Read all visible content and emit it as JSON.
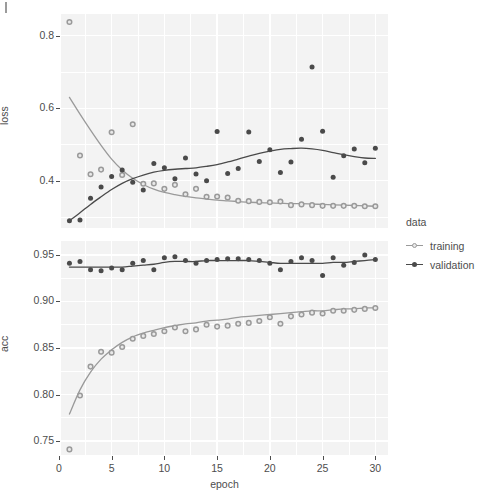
{
  "chart_data": {
    "type": "scatter",
    "title": "",
    "xlabel": "epoch",
    "panels": [
      {
        "id": "loss",
        "ylabel": "loss",
        "ylim": [
          0.27,
          0.86
        ],
        "yticks": [
          0.4,
          0.6,
          0.8
        ],
        "ytick_labels": [
          "0.4",
          "0.6",
          "0.8"
        ],
        "grid": true
      },
      {
        "id": "acc",
        "ylabel": "acc",
        "ylim": [
          0.735,
          0.965
        ],
        "yticks": [
          0.75,
          0.8,
          0.85,
          0.9,
          0.95
        ],
        "ytick_labels": [
          "0.75",
          "0.80",
          "0.85",
          "0.90",
          "0.95"
        ],
        "grid": true
      }
    ],
    "xlim": [
      0.2,
      31.2
    ],
    "xticks": [
      0,
      5,
      10,
      15,
      20,
      25,
      30
    ],
    "xtick_labels": [
      "0",
      "5",
      "10",
      "15",
      "20",
      "25",
      "30"
    ],
    "legend": {
      "title": "data",
      "position": "right",
      "entries": [
        {
          "label": "training",
          "color": "#9a9a9a",
          "marker": "open-circle"
        },
        {
          "label": "validation",
          "color": "#4a4a4a",
          "marker": "filled-circle"
        }
      ]
    },
    "colors": {
      "training": "#9a9a9a",
      "validation": "#4a4a4a",
      "panel_background": "#f3f3f3",
      "gridline": "#ffffff",
      "text": "#4d4d4d",
      "page_background": "#ffffff"
    },
    "x": [
      1,
      2,
      3,
      4,
      5,
      6,
      7,
      8,
      9,
      10,
      11,
      12,
      13,
      14,
      15,
      16,
      17,
      18,
      19,
      20,
      21,
      22,
      23,
      24,
      25,
      26,
      27,
      28,
      29,
      30
    ],
    "series": [
      {
        "name": "training",
        "panel": "loss",
        "values": [
          0.838,
          0.47,
          0.418,
          0.431,
          0.534,
          0.416,
          0.556,
          0.392,
          0.393,
          0.378,
          0.389,
          0.363,
          0.378,
          0.356,
          0.357,
          0.354,
          0.345,
          0.344,
          0.342,
          0.341,
          0.343,
          0.333,
          0.335,
          0.333,
          0.331,
          0.331,
          0.331,
          0.331,
          0.33,
          0.33
        ],
        "smooth": [
          0.63,
          0.584,
          0.54,
          0.498,
          0.46,
          0.43,
          0.407,
          0.39,
          0.377,
          0.368,
          0.362,
          0.357,
          0.353,
          0.35,
          0.347,
          0.345,
          0.343,
          0.341,
          0.34,
          0.339,
          0.338,
          0.337,
          0.337,
          0.336,
          0.335,
          0.334,
          0.333,
          0.332,
          0.331,
          0.33
        ]
      },
      {
        "name": "validation",
        "panel": "loss",
        "values": [
          0.29,
          0.292,
          0.352,
          0.383,
          0.412,
          0.43,
          0.396,
          0.375,
          0.448,
          0.436,
          0.406,
          0.463,
          0.419,
          0.4,
          0.536,
          0.42,
          0.434,
          0.535,
          0.453,
          0.486,
          0.423,
          0.452,
          0.515,
          0.714,
          0.537,
          0.41,
          0.469,
          0.488,
          0.45,
          0.49
        ],
        "smooth": [
          0.29,
          0.312,
          0.335,
          0.356,
          0.376,
          0.393,
          0.406,
          0.416,
          0.424,
          0.429,
          0.432,
          0.434,
          0.436,
          0.44,
          0.445,
          0.452,
          0.46,
          0.468,
          0.476,
          0.482,
          0.487,
          0.489,
          0.49,
          0.488,
          0.484,
          0.478,
          0.472,
          0.467,
          0.463,
          0.462
        ]
      },
      {
        "name": "training",
        "panel": "acc",
        "values": [
          0.741,
          0.799,
          0.83,
          0.846,
          0.845,
          0.851,
          0.86,
          0.863,
          0.865,
          0.868,
          0.872,
          0.868,
          0.87,
          0.875,
          0.873,
          0.874,
          0.876,
          0.877,
          0.879,
          0.883,
          0.876,
          0.884,
          0.886,
          0.888,
          0.887,
          0.89,
          0.89,
          0.891,
          0.892,
          0.893
        ],
        "smooth": [
          0.779,
          0.805,
          0.824,
          0.838,
          0.848,
          0.856,
          0.862,
          0.866,
          0.869,
          0.872,
          0.874,
          0.876,
          0.877,
          0.879,
          0.88,
          0.881,
          0.883,
          0.884,
          0.885,
          0.886,
          0.887,
          0.888,
          0.889,
          0.89,
          0.89,
          0.891,
          0.892,
          0.892,
          0.893,
          0.893
        ]
      },
      {
        "name": "validation",
        "panel": "acc",
        "values": [
          0.941,
          0.943,
          0.934,
          0.933,
          0.936,
          0.934,
          0.941,
          0.944,
          0.934,
          0.947,
          0.948,
          0.944,
          0.941,
          0.944,
          0.945,
          0.946,
          0.946,
          0.945,
          0.944,
          0.941,
          0.934,
          0.943,
          0.947,
          0.944,
          0.928,
          0.947,
          0.939,
          0.942,
          0.95,
          0.945
        ],
        "smooth": [
          0.937,
          0.937,
          0.937,
          0.937,
          0.937,
          0.937,
          0.938,
          0.939,
          0.94,
          0.942,
          0.943,
          0.943,
          0.943,
          0.944,
          0.944,
          0.944,
          0.944,
          0.944,
          0.943,
          0.942,
          0.941,
          0.941,
          0.941,
          0.941,
          0.941,
          0.942,
          0.942,
          0.943,
          0.944,
          0.945
        ]
      }
    ]
  }
}
